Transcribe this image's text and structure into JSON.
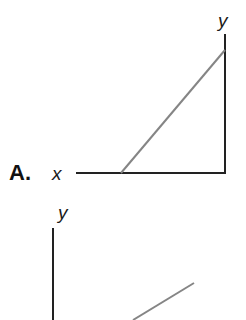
{
  "options": [
    {
      "letter": "A.",
      "x_axis_label": "x",
      "y_axis_label": "y",
      "description": "Vertical y-axis on the right, horizontal x-axis extending left; grey line rising from x-axis to y-axis",
      "axes": {
        "vertical": {
          "x": 225,
          "y1": 34,
          "y2": 173
        },
        "horizontal": {
          "x1": 76,
          "x2": 225,
          "y": 173
        }
      },
      "line": {
        "x1": 121,
        "y1": 173,
        "x2": 225,
        "y2": 50
      }
    },
    {
      "letter": "",
      "x_axis_label": "",
      "y_axis_label": "y",
      "description": "Vertical y-axis on the left (partially visible); grey line rising to the right",
      "axes": {
        "vertical": {
          "x": 53,
          "y1": 228,
          "y2": 320
        }
      },
      "line": {
        "x1": 133,
        "y1": 320,
        "x2": 194,
        "y2": 283
      }
    }
  ],
  "colors": {
    "axis": "#222222",
    "line": "#858585",
    "text": "#1a1a1a",
    "background": "#ffffff"
  }
}
